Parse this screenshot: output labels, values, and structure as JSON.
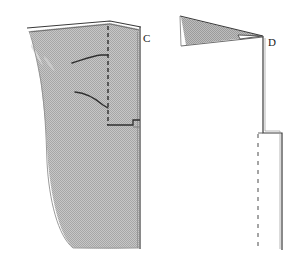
{
  "figure": {
    "title": "",
    "background_color": "#ffffff",
    "width": 305,
    "height": 267
  },
  "colors": {
    "outline": "#2b2b2b",
    "outline_soft": "#555555",
    "fill_gray": "#b9b9b9",
    "fill_gray_dark": "#a9a9a9",
    "dashed": "#3a3a3a",
    "label": "#1a1a1a",
    "background": "#ffffff"
  },
  "panels": [
    {
      "id": "panel-c",
      "label": "C",
      "label_x": 143,
      "label_y": 42,
      "description": "Shaded block cross-section with vertical dashed reference line and two curved trace lines",
      "shaded_body": {
        "fill": "#b9b9b9",
        "outline": "#2b2b2b"
      },
      "dashed_line": {
        "x": 108,
        "y_top": 26,
        "y_bottom": 126,
        "dash": "4,3"
      },
      "curves": [
        {
          "id": "curve-upper",
          "start_x": 73,
          "start_y": 63,
          "end_x": 108,
          "end_y": 55
        },
        {
          "id": "curve-lower",
          "start_x": 75,
          "start_y": 92,
          "end_x": 108,
          "end_y": 107
        }
      ],
      "right_edge": {
        "x": 140,
        "y_top": 27,
        "y_bottom": 249
      }
    },
    {
      "id": "panel-d",
      "label": "D",
      "label_x": 268,
      "label_y": 46,
      "description": "Thin shaded wedge tapering to a point with vertical dashed reference line and stepped solid edge",
      "wedge": {
        "fill": "#b9b9b9",
        "outline": "#2b2b2b",
        "apex_x": 263,
        "apex_y": 36,
        "top_left_x": 181,
        "top_left_y": 17,
        "bottom_left_x": 186,
        "bottom_left_y": 45
      },
      "dashed_line": {
        "x": 258,
        "y_top": 134,
        "y_bottom": 250,
        "dash": "4,4"
      },
      "solid_edge": {
        "x_upper": 263,
        "y_top": 36,
        "y_step": 133,
        "x_lower": 282,
        "y_bottom": 250
      }
    }
  ]
}
